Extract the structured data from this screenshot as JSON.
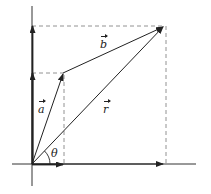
{
  "diagram": {
    "title": "",
    "labels": {
      "a": "a",
      "b": "b",
      "r": "r",
      "theta": "θ"
    },
    "colors": {
      "stroke": "#222222",
      "dashed": "#777777",
      "background": "#ffffff"
    },
    "points": {
      "origin": [
        32,
        164
      ],
      "a_tip": [
        63,
        73
      ],
      "r_tip": [
        164,
        26
      ]
    }
  }
}
